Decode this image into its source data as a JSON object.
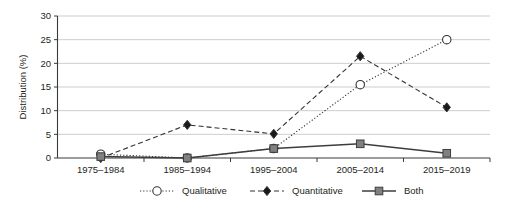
{
  "chart_data": {
    "type": "line",
    "title": "",
    "xlabel": "",
    "ylabel": "Distribution (%)",
    "categories": [
      "1975–1984",
      "1985–1994",
      "1995–2004",
      "2005–2014",
      "2015–2019"
    ],
    "ylim": [
      0,
      30
    ],
    "yticks": [
      0,
      5,
      10,
      15,
      20,
      25,
      30
    ],
    "ytick_labels": [
      "0",
      "5",
      "10",
      "15",
      "20",
      "25",
      "30"
    ],
    "grid": "horizontal",
    "legend_position": "bottom",
    "series": [
      {
        "name": "Qualitative",
        "marker": "open-circle",
        "line_style": "dotted",
        "color": "#333333",
        "marker_fill": "#ffffff",
        "values": [
          0.8,
          0.0,
          2.0,
          15.5,
          25.0
        ]
      },
      {
        "name": "Quantitative",
        "marker": "filled-diamond",
        "line_style": "dashed",
        "color": "#333333",
        "marker_fill": "#1a1a1a",
        "values": [
          0.0,
          7.0,
          5.1,
          21.5,
          10.7
        ]
      },
      {
        "name": "Both",
        "marker": "filled-square",
        "line_style": "solid",
        "color": "#3d3d3d",
        "marker_fill": "#808080",
        "values": [
          0.3,
          0.0,
          2.0,
          3.0,
          1.0
        ]
      }
    ]
  },
  "axis": {
    "y_title": "Distribution (%)"
  },
  "legend": {
    "items": [
      {
        "label": "Qualitative"
      },
      {
        "label": "Quantitative"
      },
      {
        "label": "Both"
      }
    ]
  }
}
